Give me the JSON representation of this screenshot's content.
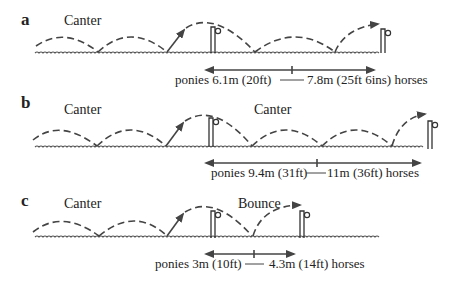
{
  "figure": {
    "panels": [
      {
        "id": "a",
        "letter": "a",
        "gait_labels": [
          "Canter"
        ],
        "distance_text": "ponies 6.1m (20ft) —— 7.8m (25ft 6ins) horses",
        "distance_left": "ponies 6.1m (20ft)",
        "distance_right": "7.8m (25ft 6ins) horses",
        "fence_count": 2
      },
      {
        "id": "b",
        "letter": "b",
        "gait_labels": [
          "Canter",
          "Canter"
        ],
        "distance_text": "ponies 9.4m (31ft) —— 11m (36ft) horses",
        "distance_left": "ponies 9.4m (31ft)",
        "distance_right": "11m (36ft) horses",
        "fence_count": 2
      },
      {
        "id": "c",
        "letter": "c",
        "gait_labels": [
          "Canter",
          "Bounce"
        ],
        "distance_text": "ponies 3m (10ft) —— 4.3m (14ft) horses",
        "distance_left": "ponies 3m (10ft)",
        "distance_right": "4.3m (14ft) horses",
        "fence_count": 2
      }
    ]
  }
}
